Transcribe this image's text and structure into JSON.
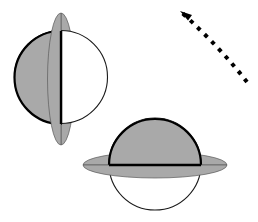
{
  "figure": {
    "canvas": {
      "width": 258,
      "height": 222,
      "background": "#ffffff"
    },
    "colors": {
      "shaded_fill": "#a9a9a9",
      "ring_fill": "#a9a9a9",
      "unshaded_fill": "#ffffff",
      "outline_heavy": "#000000",
      "outline_light": "#1a1a1a",
      "arrow": "#000000"
    },
    "objects": [
      {
        "name": "ringed-sphere-vertical-ring",
        "label": "Sphere with vertical ring, left hemisphere shaded",
        "sphere": {
          "cx": 61,
          "cy": 77,
          "r": 46.5
        },
        "ring": {
          "cx": 61,
          "cy": 79,
          "rx": 13.5,
          "ry": 66,
          "orientation": "vertical"
        },
        "shaded_half": "left",
        "terminator": {
          "x": 61,
          "y_top": 31,
          "y_bottom": 124
        },
        "outline_width": 2.2,
        "sphere_outline_width": 1.1
      },
      {
        "name": "ringed-sphere-horizontal-ring",
        "label": "Sphere with horizontal ring, top hemisphere shaded",
        "sphere": {
          "cx": 155,
          "cy": 164,
          "r": 46
        },
        "ring": {
          "cx": 155,
          "cy": 165,
          "rx": 72,
          "ry": 13,
          "orientation": "horizontal"
        },
        "shaded_half": "top",
        "terminator": {
          "y": 165,
          "x_left": 109,
          "x_right": 201
        },
        "outline_width": 2.2,
        "sphere_outline_width": 1.1
      }
    ],
    "arrow": {
      "name": "rotation-direction-arrow",
      "style": "dashed-curved",
      "direction": "up-left",
      "dash_pattern": "4 6",
      "stroke_width": 4,
      "path": "M 247 82 Q 219 46 181 12",
      "head": {
        "x": 180,
        "y": 11,
        "rotation_deg": -138,
        "size": 8
      }
    }
  }
}
